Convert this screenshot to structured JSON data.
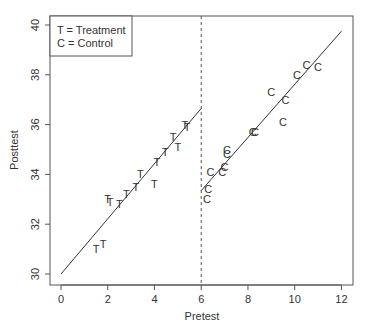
{
  "chart_data": {
    "type": "scatter",
    "title": "",
    "xlabel": "Pretest",
    "ylabel": "Posttest",
    "xlim": [
      -0.5,
      12.5
    ],
    "ylim": [
      29.6,
      40.4
    ],
    "xticks": [
      0,
      2,
      4,
      6,
      8,
      10,
      12
    ],
    "yticks": [
      30,
      32,
      34,
      36,
      38,
      40
    ],
    "grid": false,
    "legend": {
      "position": "top-left",
      "entries": [
        "T = Treatment",
        "C = Control"
      ]
    },
    "cutoff": {
      "x": 6,
      "style": "dashed"
    },
    "series": [
      {
        "name": "Treatment",
        "marker": "T",
        "points": [
          [
            1.5,
            31.0
          ],
          [
            1.8,
            31.2
          ],
          [
            2.0,
            33.0
          ],
          [
            2.1,
            32.9
          ],
          [
            2.5,
            32.8
          ],
          [
            2.8,
            33.2
          ],
          [
            3.2,
            33.5
          ],
          [
            3.4,
            34.0
          ],
          [
            4.0,
            33.6
          ],
          [
            4.1,
            34.5
          ],
          [
            4.45,
            34.9
          ],
          [
            4.8,
            35.5
          ],
          [
            5.0,
            35.1
          ],
          [
            5.3,
            36.0
          ],
          [
            5.4,
            35.9
          ]
        ],
        "fit_line": [
          [
            0,
            30.0
          ],
          [
            6,
            36.65
          ]
        ]
      },
      {
        "name": "Control",
        "marker": "C",
        "points": [
          [
            6.25,
            33.0
          ],
          [
            6.3,
            33.4
          ],
          [
            6.4,
            34.1
          ],
          [
            6.9,
            34.1
          ],
          [
            7.0,
            34.3
          ],
          [
            7.1,
            34.8
          ],
          [
            7.1,
            35.0
          ],
          [
            8.2,
            35.7
          ],
          [
            8.3,
            35.7
          ],
          [
            9.0,
            37.3
          ],
          [
            9.5,
            36.1
          ],
          [
            9.6,
            37.0
          ],
          [
            10.1,
            38.0
          ],
          [
            10.5,
            38.4
          ],
          [
            11.0,
            38.3
          ]
        ],
        "fit_line": [
          [
            6,
            33.35
          ],
          [
            12,
            39.75
          ]
        ]
      }
    ]
  },
  "labels": {
    "xlabel": "Pretest",
    "ylabel": "Posttest",
    "legend_t": "T = Treatment",
    "legend_c": "C = Control"
  }
}
